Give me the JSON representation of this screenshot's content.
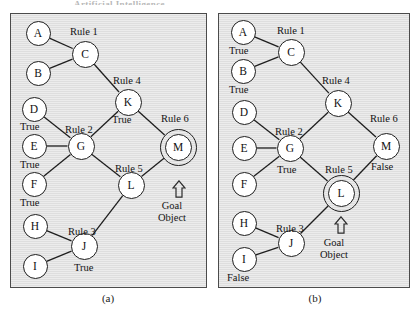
{
  "top_cropped_text": "Artificial Intelligence",
  "captions": {
    "a": "(a)",
    "b": "(b)"
  },
  "goal": {
    "arrow_icon": "up-arrow-icon",
    "line1": "Goal",
    "line2": "Object"
  },
  "panel_a": {
    "nodes": [
      {
        "id": "A",
        "label": "A",
        "cx": 38,
        "cy": 33,
        "size": "sm",
        "double": false
      },
      {
        "id": "B",
        "label": "B",
        "cx": 38,
        "cy": 73,
        "size": "sm",
        "double": false
      },
      {
        "id": "C",
        "label": "C",
        "cx": 85,
        "cy": 54,
        "size": "md",
        "double": false
      },
      {
        "id": "D",
        "label": "D",
        "cx": 34,
        "cy": 109,
        "size": "sm",
        "double": false
      },
      {
        "id": "E",
        "label": "E",
        "cx": 34,
        "cy": 146,
        "size": "sm",
        "double": false
      },
      {
        "id": "F",
        "label": "F",
        "cx": 34,
        "cy": 184,
        "size": "sm",
        "double": false
      },
      {
        "id": "G",
        "label": "G",
        "cx": 81,
        "cy": 146,
        "size": "md",
        "double": false
      },
      {
        "id": "H",
        "label": "H",
        "cx": 35,
        "cy": 226,
        "size": "sm",
        "double": false
      },
      {
        "id": "I",
        "label": "I",
        "cx": 35,
        "cy": 266,
        "size": "sm",
        "double": false
      },
      {
        "id": "J",
        "label": "J",
        "cx": 84,
        "cy": 246,
        "size": "md",
        "double": false
      },
      {
        "id": "K",
        "label": "K",
        "cx": 128,
        "cy": 102,
        "size": "md",
        "double": false
      },
      {
        "id": "L",
        "label": "L",
        "cx": 131,
        "cy": 185,
        "size": "md",
        "double": false
      },
      {
        "id": "M",
        "label": "M",
        "cx": 178,
        "cy": 147,
        "size": "md",
        "double": true
      }
    ],
    "edges": [
      [
        "A",
        "C"
      ],
      [
        "B",
        "C"
      ],
      [
        "C",
        "K"
      ],
      [
        "D",
        "G"
      ],
      [
        "E",
        "G"
      ],
      [
        "F",
        "G"
      ],
      [
        "G",
        "K"
      ],
      [
        "G",
        "L"
      ],
      [
        "H",
        "J"
      ],
      [
        "I",
        "J"
      ],
      [
        "J",
        "L"
      ],
      [
        "K",
        "M"
      ],
      [
        "L",
        "M"
      ]
    ],
    "rule_labels": [
      {
        "text": "Rule 1",
        "x": 70,
        "y": 26
      },
      {
        "text": "Rule 4",
        "x": 113,
        "y": 75
      },
      {
        "text": "Rule 6",
        "x": 161,
        "y": 113
      },
      {
        "text": "Rule 2",
        "x": 65,
        "y": 124
      },
      {
        "text": "Rule 5",
        "x": 115,
        "y": 163
      },
      {
        "text": "Rule 3",
        "x": 68,
        "y": 226
      }
    ],
    "truth_labels": [
      {
        "text": "True",
        "x": 20,
        "y": 121
      },
      {
        "text": "True",
        "x": 20,
        "y": 159
      },
      {
        "text": "True",
        "x": 20,
        "y": 197
      },
      {
        "text": "True",
        "x": 112,
        "y": 114
      },
      {
        "text": "True",
        "x": 74,
        "y": 262
      }
    ],
    "goal_arrow": {
      "x": 172,
      "y": 180
    },
    "goal_text": {
      "x": 158,
      "y": 200
    }
  },
  "panel_b": {
    "nodes": [
      {
        "id": "A",
        "label": "A",
        "cx": 243,
        "cy": 32,
        "size": "sm",
        "double": false
      },
      {
        "id": "B",
        "label": "B",
        "cx": 243,
        "cy": 71,
        "size": "sm",
        "double": false
      },
      {
        "id": "C",
        "label": "C",
        "cx": 291,
        "cy": 52,
        "size": "md",
        "double": false
      },
      {
        "id": "D",
        "label": "D",
        "cx": 244,
        "cy": 112,
        "size": "sm",
        "double": false
      },
      {
        "id": "E",
        "label": "E",
        "cx": 244,
        "cy": 148,
        "size": "sm",
        "double": false
      },
      {
        "id": "F",
        "label": "F",
        "cx": 244,
        "cy": 184,
        "size": "sm",
        "double": false
      },
      {
        "id": "G",
        "label": "G",
        "cx": 290,
        "cy": 148,
        "size": "md",
        "double": false
      },
      {
        "id": "H",
        "label": "H",
        "cx": 244,
        "cy": 223,
        "size": "sm",
        "double": false
      },
      {
        "id": "I",
        "label": "I",
        "cx": 244,
        "cy": 259,
        "size": "sm",
        "double": false
      },
      {
        "id": "J",
        "label": "J",
        "cx": 291,
        "cy": 243,
        "size": "md",
        "double": false
      },
      {
        "id": "K",
        "label": "K",
        "cx": 338,
        "cy": 103,
        "size": "md",
        "double": false
      },
      {
        "id": "L",
        "label": "L",
        "cx": 341,
        "cy": 193,
        "size": "md",
        "double": true
      },
      {
        "id": "M",
        "label": "M",
        "cx": 386,
        "cy": 146,
        "size": "md",
        "double": false
      }
    ],
    "edges": [
      [
        "A",
        "C"
      ],
      [
        "B",
        "C"
      ],
      [
        "C",
        "K"
      ],
      [
        "D",
        "G"
      ],
      [
        "E",
        "G"
      ],
      [
        "F",
        "G"
      ],
      [
        "G",
        "K"
      ],
      [
        "G",
        "L"
      ],
      [
        "H",
        "J"
      ],
      [
        "I",
        "J"
      ],
      [
        "J",
        "L"
      ],
      [
        "K",
        "M"
      ],
      [
        "L",
        "M"
      ]
    ],
    "rule_labels": [
      {
        "text": "Rule 1",
        "x": 277,
        "y": 25
      },
      {
        "text": "Rule 4",
        "x": 322,
        "y": 75
      },
      {
        "text": "Rule 6",
        "x": 370,
        "y": 113
      },
      {
        "text": "Rule 2",
        "x": 275,
        "y": 126
      },
      {
        "text": "Rule 5",
        "x": 325,
        "y": 164
      },
      {
        "text": "Rule 3",
        "x": 276,
        "y": 223
      }
    ],
    "truth_labels": [
      {
        "text": "True",
        "x": 229,
        "y": 45
      },
      {
        "text": "True",
        "x": 229,
        "y": 84
      },
      {
        "text": "True",
        "x": 277,
        "y": 164
      },
      {
        "text": "False",
        "x": 371,
        "y": 161
      },
      {
        "text": "False",
        "x": 227,
        "y": 272
      }
    ],
    "goal_arrow": {
      "x": 334,
      "y": 216
    },
    "goal_text": {
      "x": 320,
      "y": 237
    }
  },
  "colors": {
    "panel_fill": "#e2e2e2",
    "panel_border": "#4b4b4b",
    "node_fill": "#ffffff",
    "node_stroke": "#1e1e1e",
    "text": "#141414"
  }
}
